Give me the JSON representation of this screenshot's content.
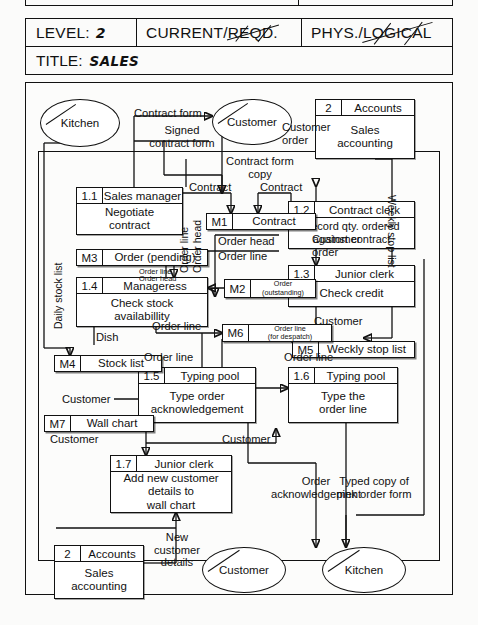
{
  "form_header": {
    "level_label": "LEVEL:",
    "level_value": "2",
    "current_required": "CURRENT/",
    "current_required_struck": "REQD.",
    "phys_logical": "PHYS./",
    "phys_logical_struck": "LOGICAL",
    "title_label": "TITLE:",
    "title_value": "SALES"
  },
  "externals": {
    "kitchen_top": "Kitchen",
    "customer_top": "Customer",
    "customer_bottom": "Customer",
    "kitchen_bottom": "Kitchen"
  },
  "processes": [
    {
      "id": "1.1",
      "who": "Sales manager",
      "body": "Negotiate\ncontract"
    },
    {
      "id": "1.2",
      "who": "Contract clerk",
      "body": "Record qty. ordered\nagainst contract"
    },
    {
      "id": "1.3",
      "who": "Junior clerk",
      "body": "Check credit"
    },
    {
      "id": "1.4",
      "who": "Manageress",
      "body": "Check stock\navailabillity"
    },
    {
      "id": "1.5",
      "who": "Typing pool",
      "body": "Type order\nacknowledgement"
    },
    {
      "id": "1.6",
      "who": "Typing pool",
      "body": "Type the\norder line"
    },
    {
      "id": "1.7",
      "who": "Junior clerk",
      "body": "Add new customer\ndetails to\nwall chart"
    }
  ],
  "accounts_top": {
    "id": "2",
    "who": "Accounts",
    "body": "Sales\naccounting"
  },
  "accounts_bottom": {
    "id": "2",
    "who": "Accounts",
    "body": "Sales\naccounting"
  },
  "stores": [
    {
      "id": "M1",
      "name": "Contract",
      "sub": ""
    },
    {
      "id": "M2",
      "name": "Order",
      "sub": "(outstanding)"
    },
    {
      "id": "M3",
      "name": "Order (pending)",
      "sub": ""
    },
    {
      "id": "M4",
      "name": "Stock list",
      "sub": ""
    },
    {
      "id": "M5",
      "name": "Weckly stop list",
      "sub": ""
    },
    {
      "id": "M6",
      "name": "Order line",
      "sub": "(for despatch)"
    },
    {
      "id": "M7",
      "name": "Wall chart",
      "sub": ""
    }
  ],
  "flows": {
    "contract_form": "Contract form",
    "signed_contract_form": "Signed\ncontract form",
    "contract_form_copy": "Contract form\ncopy",
    "customer_order_top": "Customer\norder",
    "contract_a": "Contract",
    "contract_b": "Contract",
    "order_head": "Order head",
    "order_line_1": "Order line",
    "customer_order_mid": "Customer\norder",
    "daily_stock_list": "Daily stock list",
    "weekly_stop_list": "Weekly stop list",
    "order_line_v": "Order line",
    "order_head_v": "Order head",
    "order_line_small": "Order line",
    "order_head_small": "Order head",
    "dish": "Dish",
    "order_line_2": "Order line",
    "order_line_3": "Order line",
    "order_line_4": "Order line",
    "customer_1": "Customer",
    "customer_2": "Customer",
    "customer_3": "Customer",
    "customer_4": "Customer",
    "order_acknowledgement": "Order\nacknowledgement",
    "typed_copy": "Typed copy of\npink order form",
    "new_customer_details": "New\ncustomer\ndetails"
  }
}
